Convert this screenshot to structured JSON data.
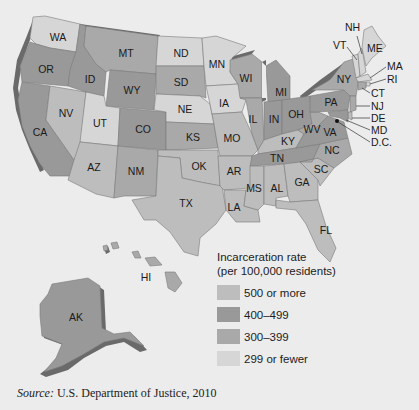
{
  "legend": {
    "title_line1": "Incarceration rate",
    "title_line2": "(per 100,000 residents)",
    "items": [
      {
        "key": "c500",
        "label": "500 or more",
        "color": "#bdbdbd"
      },
      {
        "key": "c400",
        "label": "400–499",
        "color": "#999999"
      },
      {
        "key": "c300",
        "label": "300–399",
        "color": "#a9a9a9"
      },
      {
        "key": "c299",
        "label": "299 or fewer",
        "color": "#d6d6d6"
      }
    ]
  },
  "source": {
    "prefix": "Source:",
    "text": " U.S. Department of Justice, 2010"
  },
  "states": {
    "WA": {
      "label": "WA",
      "category": "c299"
    },
    "OR": {
      "label": "OR",
      "category": "c400"
    },
    "CA": {
      "label": "CA",
      "category": "c400"
    },
    "ID": {
      "label": "ID",
      "category": "c400"
    },
    "NV": {
      "label": "NV",
      "category": "c500"
    },
    "MT": {
      "label": "MT",
      "category": "c300"
    },
    "WY": {
      "label": "WY",
      "category": "c400"
    },
    "UT": {
      "label": "UT",
      "category": "c299"
    },
    "AZ": {
      "label": "AZ",
      "category": "c500"
    },
    "CO": {
      "label": "CO",
      "category": "c400"
    },
    "NM": {
      "label": "NM",
      "category": "c300"
    },
    "ND": {
      "label": "ND",
      "category": "c299"
    },
    "SD": {
      "label": "SD",
      "category": "c300"
    },
    "NE": {
      "label": "NE",
      "category": "c299"
    },
    "KS": {
      "label": "KS",
      "category": "c300"
    },
    "OK": {
      "label": "OK",
      "category": "c500"
    },
    "TX": {
      "label": "TX",
      "category": "c500"
    },
    "MN": {
      "label": "MN",
      "category": "c299"
    },
    "IA": {
      "label": "IA",
      "category": "c299"
    },
    "MO": {
      "label": "MO",
      "category": "c500"
    },
    "AR": {
      "label": "AR",
      "category": "c500"
    },
    "LA": {
      "label": "LA",
      "category": "c500"
    },
    "WI": {
      "label": "WI",
      "category": "c300"
    },
    "IL": {
      "label": "IL",
      "category": "c300"
    },
    "MI": {
      "label": "MI",
      "category": "c400"
    },
    "IN": {
      "label": "IN",
      "category": "c400"
    },
    "OH": {
      "label": "OH",
      "category": "c400"
    },
    "KY": {
      "label": "KY",
      "category": "c500"
    },
    "TN": {
      "label": "TN",
      "category": "c400"
    },
    "MS": {
      "label": "MS",
      "category": "c500"
    },
    "AL": {
      "label": "AL",
      "category": "c500"
    },
    "GA": {
      "label": "GA",
      "category": "c500"
    },
    "FL": {
      "label": "FL",
      "category": "c500"
    },
    "SC": {
      "label": "SC",
      "category": "c500"
    },
    "NC": {
      "label": "NC",
      "category": "c300"
    },
    "VA": {
      "label": "VA",
      "category": "c400"
    },
    "WV": {
      "label": "WV",
      "category": "c300"
    },
    "PA": {
      "label": "PA",
      "category": "c400"
    },
    "NY": {
      "label": "NY",
      "category": "c300"
    },
    "VT": {
      "label": "VT",
      "category": "c299"
    },
    "NH": {
      "label": "NH",
      "category": "c299"
    },
    "ME": {
      "label": "ME",
      "category": "c299"
    },
    "MA": {
      "label": "MA",
      "category": "c299"
    },
    "RI": {
      "label": "RI",
      "category": "c299"
    },
    "CT": {
      "label": "CT",
      "category": "c300"
    },
    "NJ": {
      "label": "NJ",
      "category": "c300"
    },
    "DE": {
      "label": "DE",
      "category": "c500"
    },
    "MD": {
      "label": "MD",
      "category": "c400"
    },
    "DC": {
      "label": "D.C.",
      "category": "c500"
    },
    "AK": {
      "label": "AK",
      "category": "c400"
    },
    "HI": {
      "label": "HI",
      "category": "c300"
    }
  }
}
